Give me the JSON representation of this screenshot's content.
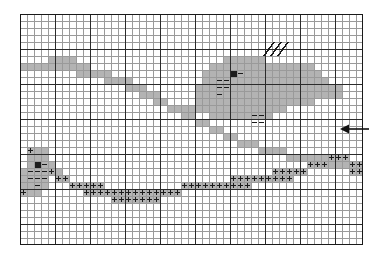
{
  "figure": {
    "type": "grid-map-diagram",
    "title": ""
  },
  "grid": {
    "columns": 49,
    "rows": 33,
    "cell_size_px": 7,
    "origin_x_px": 20,
    "origin_y_px": 14,
    "minor_line_color": "#9a9a9a",
    "major_line_color": "#2b2b2b",
    "major_line_every": 5,
    "border_color": "#1a1a1a",
    "background": "#ffffff"
  },
  "palette": {
    "shade_gray": "#b3b3b3",
    "shade_dark": "#1c1c1c",
    "symbol_ink": "#1a1a1a",
    "paper": "#ffffff"
  },
  "legend_symbols": [
    {
      "name": "plus",
      "glyph": "+",
      "meaning": "plus-marker-cell"
    },
    {
      "name": "minus",
      "glyph": "–",
      "meaning": "dash-marker-cell"
    },
    {
      "name": "slash",
      "glyph": "/",
      "meaning": "hatch-marker-cell"
    },
    {
      "name": "arrow-left",
      "glyph": "←",
      "meaning": "direction-pointer"
    }
  ],
  "shaded_cells": [
    [
      4,
      6
    ],
    [
      5,
      6
    ],
    [
      6,
      6
    ],
    [
      7,
      6
    ],
    [
      0,
      7
    ],
    [
      1,
      7
    ],
    [
      2,
      7
    ],
    [
      3,
      7
    ],
    [
      4,
      7
    ],
    [
      5,
      7
    ],
    [
      6,
      7
    ],
    [
      7,
      7
    ],
    [
      8,
      7
    ],
    [
      9,
      7
    ],
    [
      8,
      8
    ],
    [
      9,
      8
    ],
    [
      10,
      8
    ],
    [
      11,
      8
    ],
    [
      12,
      8
    ],
    [
      12,
      9
    ],
    [
      13,
      9
    ],
    [
      14,
      9
    ],
    [
      15,
      9
    ],
    [
      15,
      10
    ],
    [
      16,
      10
    ],
    [
      17,
      10
    ],
    [
      17,
      11
    ],
    [
      18,
      11
    ],
    [
      19,
      11
    ],
    [
      19,
      12
    ],
    [
      20,
      12
    ],
    [
      21,
      13
    ],
    [
      22,
      13
    ],
    [
      23,
      14
    ],
    [
      24,
      14
    ],
    [
      25,
      15
    ],
    [
      26,
      15
    ],
    [
      27,
      16
    ],
    [
      28,
      16
    ],
    [
      29,
      17
    ],
    [
      30,
      17
    ],
    [
      31,
      18
    ],
    [
      32,
      18
    ],
    [
      33,
      18
    ],
    [
      34,
      19
    ],
    [
      35,
      19
    ],
    [
      36,
      19
    ],
    [
      37,
      19
    ],
    [
      38,
      20
    ],
    [
      39,
      20
    ],
    [
      40,
      20
    ],
    [
      41,
      20
    ],
    [
      42,
      20
    ],
    [
      43,
      20
    ],
    [
      44,
      21
    ],
    [
      45,
      21
    ],
    [
      46,
      21
    ],
    [
      47,
      21
    ],
    [
      48,
      21
    ],
    [
      47,
      22
    ],
    [
      48,
      22
    ],
    [
      29,
      6
    ],
    [
      30,
      6
    ],
    [
      31,
      6
    ],
    [
      32,
      6
    ],
    [
      33,
      6
    ],
    [
      34,
      6
    ],
    [
      27,
      7
    ],
    [
      28,
      7
    ],
    [
      29,
      7
    ],
    [
      30,
      7
    ],
    [
      31,
      7
    ],
    [
      32,
      7
    ],
    [
      33,
      7
    ],
    [
      34,
      7
    ],
    [
      35,
      7
    ],
    [
      36,
      7
    ],
    [
      37,
      7
    ],
    [
      38,
      7
    ],
    [
      39,
      7
    ],
    [
      40,
      7
    ],
    [
      41,
      7
    ],
    [
      26,
      8
    ],
    [
      27,
      8
    ],
    [
      28,
      8
    ],
    [
      29,
      8
    ],
    [
      30,
      8
    ],
    [
      31,
      8
    ],
    [
      32,
      8
    ],
    [
      33,
      8
    ],
    [
      34,
      8
    ],
    [
      35,
      8
    ],
    [
      36,
      8
    ],
    [
      37,
      8
    ],
    [
      38,
      8
    ],
    [
      39,
      8
    ],
    [
      40,
      8
    ],
    [
      41,
      8
    ],
    [
      42,
      8
    ],
    [
      26,
      9
    ],
    [
      27,
      9
    ],
    [
      28,
      9
    ],
    [
      29,
      9
    ],
    [
      30,
      9
    ],
    [
      31,
      9
    ],
    [
      32,
      9
    ],
    [
      33,
      9
    ],
    [
      34,
      9
    ],
    [
      35,
      9
    ],
    [
      36,
      9
    ],
    [
      37,
      9
    ],
    [
      38,
      9
    ],
    [
      39,
      9
    ],
    [
      40,
      9
    ],
    [
      41,
      9
    ],
    [
      42,
      9
    ],
    [
      43,
      9
    ],
    [
      25,
      10
    ],
    [
      26,
      10
    ],
    [
      27,
      10
    ],
    [
      28,
      10
    ],
    [
      29,
      10
    ],
    [
      30,
      10
    ],
    [
      31,
      10
    ],
    [
      32,
      10
    ],
    [
      33,
      10
    ],
    [
      34,
      10
    ],
    [
      35,
      10
    ],
    [
      36,
      10
    ],
    [
      37,
      10
    ],
    [
      38,
      10
    ],
    [
      39,
      10
    ],
    [
      40,
      10
    ],
    [
      41,
      10
    ],
    [
      42,
      10
    ],
    [
      43,
      10
    ],
    [
      44,
      10
    ],
    [
      45,
      10
    ],
    [
      25,
      11
    ],
    [
      26,
      11
    ],
    [
      27,
      11
    ],
    [
      28,
      11
    ],
    [
      29,
      11
    ],
    [
      30,
      11
    ],
    [
      31,
      11
    ],
    [
      32,
      11
    ],
    [
      33,
      11
    ],
    [
      34,
      11
    ],
    [
      35,
      11
    ],
    [
      36,
      11
    ],
    [
      37,
      11
    ],
    [
      38,
      11
    ],
    [
      39,
      11
    ],
    [
      40,
      11
    ],
    [
      41,
      11
    ],
    [
      42,
      11
    ],
    [
      43,
      11
    ],
    [
      44,
      11
    ],
    [
      45,
      11
    ],
    [
      25,
      12
    ],
    [
      26,
      12
    ],
    [
      27,
      12
    ],
    [
      28,
      12
    ],
    [
      29,
      12
    ],
    [
      30,
      12
    ],
    [
      31,
      12
    ],
    [
      32,
      12
    ],
    [
      33,
      12
    ],
    [
      34,
      12
    ],
    [
      35,
      12
    ],
    [
      36,
      12
    ],
    [
      37,
      12
    ],
    [
      38,
      12
    ],
    [
      39,
      12
    ],
    [
      40,
      12
    ],
    [
      41,
      12
    ],
    [
      22,
      13
    ],
    [
      23,
      13
    ],
    [
      24,
      13
    ],
    [
      25,
      13
    ],
    [
      26,
      13
    ],
    [
      27,
      13
    ],
    [
      28,
      13
    ],
    [
      29,
      13
    ],
    [
      30,
      13
    ],
    [
      31,
      13
    ],
    [
      32,
      13
    ],
    [
      33,
      13
    ],
    [
      34,
      13
    ],
    [
      35,
      13
    ],
    [
      36,
      13
    ],
    [
      37,
      13
    ],
    [
      27,
      14
    ],
    [
      28,
      14
    ],
    [
      29,
      14
    ],
    [
      30,
      14
    ],
    [
      31,
      14
    ],
    [
      32,
      14
    ],
    [
      33,
      14
    ],
    [
      34,
      14
    ],
    [
      35,
      14
    ],
    [
      1,
      19
    ],
    [
      2,
      19
    ],
    [
      3,
      19
    ],
    [
      1,
      20
    ],
    [
      2,
      20
    ],
    [
      3,
      20
    ],
    [
      1,
      21
    ],
    [
      2,
      21
    ],
    [
      3,
      21
    ],
    [
      4,
      21
    ],
    [
      0,
      22
    ],
    [
      1,
      22
    ],
    [
      2,
      22
    ],
    [
      3,
      22
    ],
    [
      4,
      22
    ],
    [
      5,
      22
    ],
    [
      0,
      23
    ],
    [
      1,
      23
    ],
    [
      2,
      23
    ],
    [
      3,
      23
    ],
    [
      5,
      23
    ],
    [
      6,
      23
    ],
    [
      0,
      24
    ],
    [
      1,
      24
    ],
    [
      2,
      24
    ],
    [
      3,
      24
    ],
    [
      0,
      25
    ],
    [
      1,
      25
    ],
    [
      2,
      25
    ],
    [
      7,
      24
    ],
    [
      8,
      24
    ],
    [
      9,
      24
    ],
    [
      10,
      24
    ],
    [
      11,
      24
    ],
    [
      9,
      25
    ],
    [
      10,
      25
    ],
    [
      11,
      25
    ],
    [
      12,
      25
    ],
    [
      13,
      25
    ],
    [
      14,
      25
    ],
    [
      15,
      25
    ],
    [
      16,
      25
    ],
    [
      17,
      25
    ],
    [
      18,
      25
    ],
    [
      19,
      25
    ],
    [
      20,
      25
    ],
    [
      21,
      25
    ],
    [
      22,
      25
    ],
    [
      13,
      26
    ],
    [
      14,
      26
    ],
    [
      15,
      26
    ],
    [
      16,
      26
    ],
    [
      17,
      26
    ],
    [
      18,
      26
    ],
    [
      19,
      26
    ],
    [
      23,
      24
    ],
    [
      24,
      24
    ],
    [
      25,
      24
    ],
    [
      26,
      24
    ],
    [
      27,
      24
    ],
    [
      28,
      24
    ],
    [
      29,
      24
    ],
    [
      30,
      24
    ],
    [
      31,
      24
    ],
    [
      32,
      24
    ],
    [
      30,
      23
    ],
    [
      31,
      23
    ],
    [
      32,
      23
    ],
    [
      33,
      23
    ],
    [
      34,
      23
    ],
    [
      35,
      23
    ],
    [
      36,
      23
    ],
    [
      37,
      23
    ],
    [
      38,
      23
    ],
    [
      36,
      22
    ],
    [
      37,
      22
    ],
    [
      38,
      22
    ],
    [
      39,
      22
    ],
    [
      40,
      22
    ],
    [
      41,
      21
    ],
    [
      42,
      21
    ],
    [
      43,
      21
    ],
    [
      44,
      20
    ],
    [
      45,
      20
    ],
    [
      46,
      20
    ]
  ],
  "dark_cells": [
    [
      30,
      8
    ],
    [
      2,
      21
    ]
  ],
  "plus_cells": [
    [
      1,
      19
    ],
    [
      4,
      22
    ],
    [
      5,
      23
    ],
    [
      6,
      23
    ],
    [
      7,
      24
    ],
    [
      8,
      24
    ],
    [
      9,
      24
    ],
    [
      10,
      24
    ],
    [
      11,
      24
    ],
    [
      9,
      25
    ],
    [
      10,
      25
    ],
    [
      11,
      25
    ],
    [
      12,
      25
    ],
    [
      13,
      25
    ],
    [
      14,
      25
    ],
    [
      15,
      25
    ],
    [
      16,
      25
    ],
    [
      17,
      25
    ],
    [
      18,
      25
    ],
    [
      19,
      25
    ],
    [
      20,
      25
    ],
    [
      21,
      25
    ],
    [
      22,
      25
    ],
    [
      13,
      26
    ],
    [
      14,
      26
    ],
    [
      15,
      26
    ],
    [
      16,
      26
    ],
    [
      17,
      26
    ],
    [
      18,
      26
    ],
    [
      19,
      26
    ],
    [
      23,
      24
    ],
    [
      24,
      24
    ],
    [
      25,
      24
    ],
    [
      26,
      24
    ],
    [
      27,
      24
    ],
    [
      28,
      24
    ],
    [
      29,
      24
    ],
    [
      30,
      24
    ],
    [
      31,
      24
    ],
    [
      32,
      24
    ],
    [
      30,
      23
    ],
    [
      31,
      23
    ],
    [
      32,
      23
    ],
    [
      33,
      23
    ],
    [
      34,
      23
    ],
    [
      35,
      23
    ],
    [
      36,
      23
    ],
    [
      37,
      23
    ],
    [
      38,
      23
    ],
    [
      36,
      22
    ],
    [
      37,
      22
    ],
    [
      38,
      22
    ],
    [
      39,
      22
    ],
    [
      40,
      22
    ],
    [
      41,
      21
    ],
    [
      42,
      21
    ],
    [
      43,
      21
    ],
    [
      44,
      20
    ],
    [
      45,
      20
    ],
    [
      46,
      20
    ],
    [
      47,
      21
    ],
    [
      48,
      21
    ],
    [
      47,
      22
    ],
    [
      48,
      22
    ],
    [
      0,
      25
    ]
  ],
  "minus_cells": [
    [
      31,
      8
    ],
    [
      28,
      9
    ],
    [
      29,
      9
    ],
    [
      28,
      10
    ],
    [
      29,
      10
    ],
    [
      28,
      11
    ],
    [
      3,
      21
    ],
    [
      1,
      22
    ],
    [
      2,
      22
    ],
    [
      3,
      22
    ],
    [
      4,
      22
    ],
    [
      1,
      23
    ],
    [
      2,
      23
    ],
    [
      3,
      23
    ],
    [
      2,
      24
    ],
    [
      33,
      14
    ],
    [
      34,
      14
    ],
    [
      33,
      15
    ],
    [
      34,
      15
    ]
  ],
  "slash_cells": [
    [
      35,
      4
    ],
    [
      36,
      4
    ],
    [
      37,
      4
    ],
    [
      35,
      5
    ],
    [
      36,
      5
    ],
    [
      37,
      5
    ]
  ],
  "arrow": {
    "name": "arrow-left",
    "glyph": "←",
    "x_px": 340,
    "y_px": 121,
    "width_px": 30,
    "color": "#111111"
  }
}
